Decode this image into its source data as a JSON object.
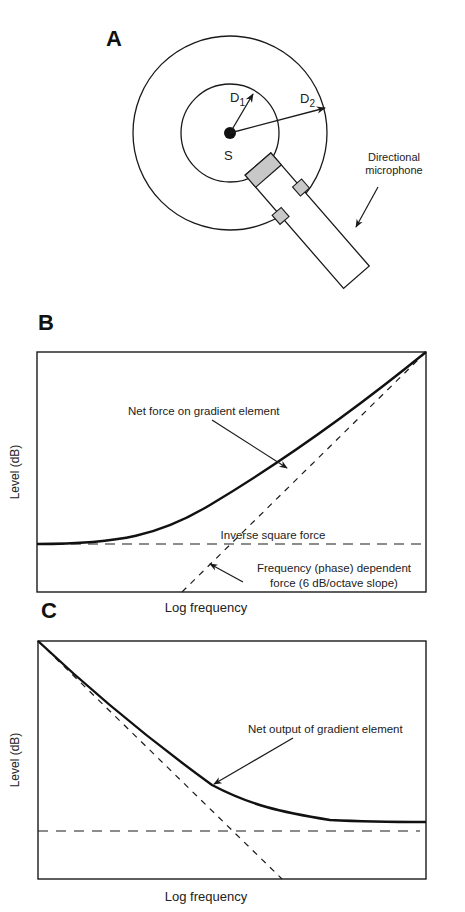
{
  "panels": {
    "a": {
      "letter": "A",
      "source_label": "S",
      "d1_label": "D",
      "d1_sub": "1",
      "d2_label": "D",
      "d2_sub": "2",
      "mic_label_line1": "Directional",
      "mic_label_line2": "microphone"
    },
    "b": {
      "letter": "B",
      "ylabel": "Level (dB)",
      "xlabel": "Log frequency",
      "net_label": "Net force on gradient element",
      "inverse_label": "Inverse square force",
      "freq_label_line1": "Frequency (phase) dependent",
      "freq_label_line2": "force (6 dB/octave slope)"
    },
    "c": {
      "letter": "C",
      "ylabel": "Level (dB)",
      "xlabel": "Log frequency",
      "net_label": "Net output of gradient element"
    }
  },
  "colors": {
    "line": "#1a1a1a",
    "element_fill": "#c8c8c8",
    "background": "#ffffff"
  }
}
